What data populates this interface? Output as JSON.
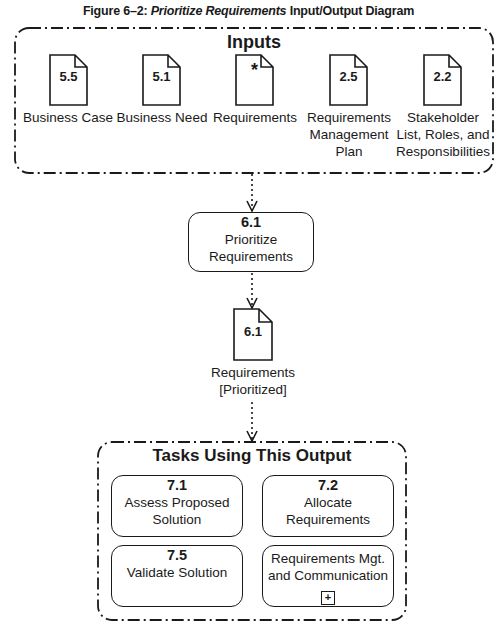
{
  "figure": {
    "title_prefix": "Figure 6–2: ",
    "title_italic": "Prioritize Requirements",
    "title_suffix": " Input/Output Diagram"
  },
  "inputs": {
    "title": "Inputs",
    "items": [
      {
        "num": "5.5",
        "label": "Business Case"
      },
      {
        "num": "5.1",
        "label": "Business Need"
      },
      {
        "num": "*",
        "label": "Requirements"
      },
      {
        "num": "2.5",
        "label": "Requirements Management Plan"
      },
      {
        "num": "2.2",
        "label": "Stakeholder List, Roles, and Responsibilities"
      }
    ]
  },
  "task": {
    "num": "6.1",
    "label": "Prioritize Requirements"
  },
  "output": {
    "num": "6.1",
    "label": "Requirements [Prioritized]"
  },
  "tasks_using": {
    "title": "Tasks Using This Output",
    "items": [
      {
        "num": "7.1",
        "label": "Assess Proposed Solution"
      },
      {
        "num": "7.2",
        "label": "Allocate Requirements"
      },
      {
        "num": "7.5",
        "label": "Validate Solution"
      },
      {
        "num": "",
        "label": "Requirements Mgt. and Communication",
        "expand": "+"
      }
    ]
  }
}
